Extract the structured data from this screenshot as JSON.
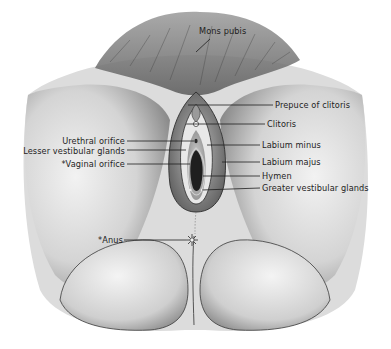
{
  "figure": {
    "colors": {
      "background": "#ffffff",
      "ink": "#1e1e1e",
      "skin_light": "#e6e6e6",
      "skin_mid": "#bdbdbd",
      "skin_dark": "#6e6e6e"
    }
  },
  "labels": [
    {
      "id": "mons-pubis",
      "text": "Mons pubis",
      "x": 199,
      "y": 28,
      "anchor": "left",
      "leader": [
        [
          210,
          39
        ],
        [
          196,
          52
        ]
      ]
    },
    {
      "id": "prepuce-of-clitoris",
      "text": "Prepuce of clitoris",
      "x": 275,
      "y": 100,
      "anchor": "left",
      "leader": [
        [
          188,
          105
        ],
        [
          273,
          105
        ]
      ]
    },
    {
      "id": "clitoris",
      "text": "Clitoris",
      "x": 267,
      "y": 119,
      "anchor": "left",
      "leader": [
        [
          186,
          124
        ],
        [
          265,
          124
        ]
      ]
    },
    {
      "id": "urethral-orifice",
      "text": "Urethral orifice",
      "x": 126,
      "y": 133,
      "anchor": "right",
      "leader": [
        [
          127,
          141
        ],
        [
          185,
          141
        ]
      ]
    },
    {
      "id": "lesser-vestibular-glands",
      "text": "Lesser vestibular glands",
      "x": 126,
      "y": 145,
      "anchor": "right",
      "leader": [
        [
          127,
          150
        ],
        [
          178,
          150
        ]
      ]
    },
    {
      "id": "vaginal-orifice",
      "text": "*Vaginal orifice",
      "x": 126,
      "y": 159,
      "anchor": "right",
      "leader": [
        [
          127,
          164
        ],
        [
          185,
          164
        ]
      ]
    },
    {
      "id": "labium-minus",
      "text": "Labium minus",
      "x": 262,
      "y": 140,
      "anchor": "left",
      "leader": [
        [
          203,
          145
        ],
        [
          260,
          145
        ]
      ]
    },
    {
      "id": "labium-majus",
      "text": "Labium majus",
      "x": 262,
      "y": 158,
      "anchor": "left",
      "leader": [
        [
          222,
          162
        ],
        [
          260,
          162
        ]
      ]
    },
    {
      "id": "hymen",
      "text": "Hymen",
      "x": 262,
      "y": 172,
      "anchor": "left",
      "leader": [
        [
          198,
          176
        ],
        [
          260,
          176
        ]
      ]
    },
    {
      "id": "greater-vestibular-glands",
      "text": "Greater vestibular glands",
      "x": 262,
      "y": 184,
      "anchor": "left",
      "leader": [
        [
          206,
          188
        ],
        [
          260,
          188
        ]
      ]
    },
    {
      "id": "anus",
      "text": "*Anus",
      "x": 98,
      "y": 235,
      "anchor": "left",
      "leader": [
        [
          124,
          240
        ],
        [
          184,
          240
        ]
      ]
    }
  ]
}
